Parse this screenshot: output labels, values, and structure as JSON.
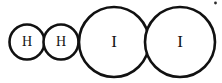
{
  "diagram": {
    "type": "space-filling-molecule-model",
    "background_color": "#ffffff",
    "stroke_color": "#111111",
    "label_color": "#141414",
    "fill_color": "#ffffff",
    "molecules": [
      {
        "name": "hydrogen-molecule",
        "formula": "H2",
        "atoms": [
          {
            "name": "hydrogen-atom-1",
            "label": "H",
            "cx": 27,
            "cy": 42,
            "r": 17.5,
            "stroke_width": 2.6,
            "font_size": 14
          },
          {
            "name": "hydrogen-atom-2",
            "label": "H",
            "cx": 61,
            "cy": 42,
            "r": 17.5,
            "stroke_width": 2.6,
            "font_size": 14
          }
        ]
      },
      {
        "name": "iodine-molecule",
        "formula": "I2",
        "atoms": [
          {
            "name": "iodine-atom-1",
            "label": "I",
            "cx": 114,
            "cy": 42,
            "r": 35,
            "stroke_width": 2.6,
            "font_size": 17
          },
          {
            "name": "iodine-atom-2",
            "label": "I",
            "cx": 180,
            "cy": 42,
            "r": 35,
            "stroke_width": 2.6,
            "font_size": 17
          }
        ]
      }
    ],
    "artifacts": [
      {
        "name": "scan-speck",
        "cx": 215.5,
        "cy": 3,
        "r": 1.4
      }
    ]
  }
}
